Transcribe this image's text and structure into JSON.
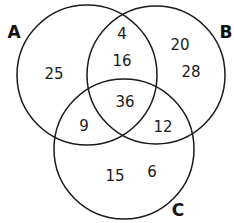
{
  "diagram": {
    "type": "venn",
    "sets": [
      {
        "label": "A",
        "color": "#1a1a1a"
      },
      {
        "label": "B",
        "color": "#1a1a1a"
      },
      {
        "label": "C",
        "color": "#1a1a1a"
      }
    ],
    "regions": {
      "A_only": "25",
      "B_only_top": "20",
      "B_only_bottom": "28",
      "AB_only_top": "4",
      "AB_only_bottom": "16",
      "ABC": "36",
      "AC_only": "9",
      "BC_only": "12",
      "C_only_left": "15",
      "C_only_right": "6"
    }
  }
}
